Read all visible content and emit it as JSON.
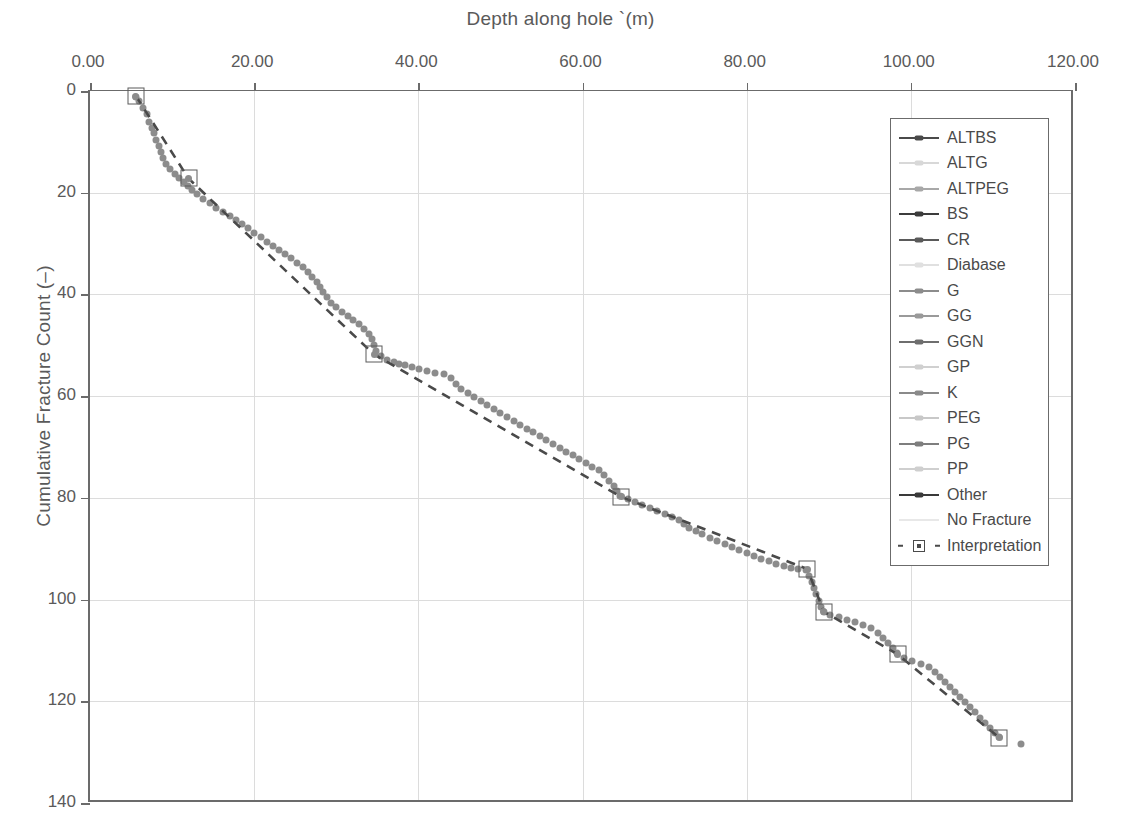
{
  "chart_data": {
    "type": "scatter",
    "title": "",
    "xlabel": "Depth along hole `(m)",
    "ylabel": "Cumulative Fracture Count (–)",
    "xlim": [
      0,
      120
    ],
    "ylim": [
      140,
      0
    ],
    "y_axis_inverted": true,
    "grid": true,
    "xticks": [
      "0.00",
      "20.00",
      "40.00",
      "60.00",
      "80.00",
      "100.00",
      "120.00"
    ],
    "xtick_values": [
      0,
      20,
      40,
      60,
      80,
      100,
      120
    ],
    "yticks": [
      "0",
      "20",
      "40",
      "60",
      "80",
      "100",
      "120",
      "140"
    ],
    "ytick_values": [
      0,
      20,
      40,
      60,
      80,
      100,
      120,
      140
    ],
    "x_axis_position": "top",
    "legend_position": "top-right",
    "legend": [
      {
        "label": "ALTBS",
        "color": "#4a4a4a",
        "style": "line-marker"
      },
      {
        "label": "ALTG",
        "color": "#d8d8d8",
        "style": "line-marker"
      },
      {
        "label": "ALTPEG",
        "color": "#a8a8a8",
        "style": "line-marker"
      },
      {
        "label": "BS",
        "color": "#3c3c3c",
        "style": "line-marker"
      },
      {
        "label": "CR",
        "color": "#5a5a5a",
        "style": "line-marker"
      },
      {
        "label": "Diabase",
        "color": "#e0e0e0",
        "style": "line-marker"
      },
      {
        "label": "G",
        "color": "#8c8c8c",
        "style": "line-marker"
      },
      {
        "label": "GG",
        "color": "#9a9a9a",
        "style": "line-marker"
      },
      {
        "label": "GGN",
        "color": "#6e6e6e",
        "style": "line-marker"
      },
      {
        "label": "GP",
        "color": "#d0d0d0",
        "style": "line-marker"
      },
      {
        "label": "K",
        "color": "#8a8a8a",
        "style": "line-marker"
      },
      {
        "label": "PEG",
        "color": "#c8c8c8",
        "style": "line-marker"
      },
      {
        "label": "PG",
        "color": "#7e7e7e",
        "style": "line-marker"
      },
      {
        "label": "PP",
        "color": "#cfcfcf",
        "style": "line-marker"
      },
      {
        "label": "Other",
        "color": "#3a3a3a",
        "style": "line-marker"
      },
      {
        "label": "No Fracture",
        "color": "#e8e8e8",
        "style": "line"
      },
      {
        "label": "Interpretation",
        "color": "#4a4a4a",
        "style": "dashed-square"
      }
    ],
    "series": [
      {
        "name": "Fracture data points",
        "style": "scatter",
        "color": "#8c8c8c",
        "points": [
          [
            5.6,
            1.2
          ],
          [
            6.0,
            2.0
          ],
          [
            6.4,
            3.4
          ],
          [
            6.9,
            4.6
          ],
          [
            7.2,
            6.0
          ],
          [
            7.5,
            7.2
          ],
          [
            7.8,
            8.3
          ],
          [
            8.1,
            9.6
          ],
          [
            8.4,
            10.8
          ],
          [
            8.6,
            12.0
          ],
          [
            8.9,
            13.2
          ],
          [
            9.3,
            14.3
          ],
          [
            9.8,
            15.4
          ],
          [
            10.3,
            16.3
          ],
          [
            10.9,
            17.1
          ],
          [
            11.4,
            17.8
          ],
          [
            11.9,
            18.6
          ],
          [
            12.4,
            19.4
          ],
          [
            13.0,
            20.3
          ],
          [
            13.8,
            21.2
          ],
          [
            14.6,
            22.1
          ],
          [
            15.4,
            23.0
          ],
          [
            16.2,
            23.8
          ],
          [
            17.0,
            24.6
          ],
          [
            17.8,
            25.4
          ],
          [
            18.5,
            26.2
          ],
          [
            19.2,
            27.0
          ],
          [
            20.0,
            27.9
          ],
          [
            20.8,
            28.8
          ],
          [
            21.6,
            29.6
          ],
          [
            22.3,
            30.4
          ],
          [
            23.0,
            31.2
          ],
          [
            23.8,
            32.0
          ],
          [
            24.5,
            32.9
          ],
          [
            25.2,
            33.8
          ],
          [
            25.9,
            34.7
          ],
          [
            26.5,
            35.6
          ],
          [
            27.1,
            36.6
          ],
          [
            27.6,
            37.6
          ],
          [
            28.0,
            38.6
          ],
          [
            28.4,
            39.6
          ],
          [
            28.9,
            40.6
          ],
          [
            29.4,
            41.6
          ],
          [
            30.0,
            42.5
          ],
          [
            30.7,
            43.4
          ],
          [
            31.4,
            44.2
          ],
          [
            32.1,
            45.0
          ],
          [
            32.8,
            45.9
          ],
          [
            33.4,
            46.8
          ],
          [
            34.0,
            47.8
          ],
          [
            34.4,
            48.8
          ],
          [
            34.6,
            50.0
          ],
          [
            34.9,
            51.2
          ],
          [
            35.5,
            52.2
          ],
          [
            36.2,
            52.8
          ],
          [
            37.0,
            53.2
          ],
          [
            37.7,
            53.6
          ],
          [
            38.4,
            53.9
          ],
          [
            39.2,
            54.2
          ],
          [
            40.1,
            54.6
          ],
          [
            41.0,
            55.0
          ],
          [
            42.0,
            55.4
          ],
          [
            43.1,
            55.6
          ],
          [
            44.0,
            56.4
          ],
          [
            44.6,
            57.6
          ],
          [
            45.2,
            58.6
          ],
          [
            46.0,
            59.4
          ],
          [
            46.8,
            60.2
          ],
          [
            47.6,
            61.0
          ],
          [
            48.4,
            61.8
          ],
          [
            49.2,
            62.6
          ],
          [
            50.0,
            63.4
          ],
          [
            50.8,
            64.1
          ],
          [
            51.6,
            64.9
          ],
          [
            52.4,
            65.6
          ],
          [
            53.2,
            66.4
          ],
          [
            54.0,
            67.1
          ],
          [
            54.8,
            67.9
          ],
          [
            55.6,
            68.6
          ],
          [
            56.4,
            69.4
          ],
          [
            57.2,
            70.1
          ],
          [
            58.0,
            70.9
          ],
          [
            58.8,
            71.6
          ],
          [
            59.6,
            72.4
          ],
          [
            60.4,
            73.1
          ],
          [
            61.2,
            73.9
          ],
          [
            62.0,
            74.6
          ],
          [
            62.6,
            75.6
          ],
          [
            63.2,
            76.6
          ],
          [
            63.8,
            77.6
          ],
          [
            64.2,
            78.6
          ],
          [
            64.6,
            79.6
          ],
          [
            65.5,
            80.2
          ],
          [
            66.4,
            80.8
          ],
          [
            67.3,
            81.4
          ],
          [
            68.2,
            82.0
          ],
          [
            69.1,
            82.6
          ],
          [
            70.0,
            83.2
          ],
          [
            70.9,
            83.8
          ],
          [
            71.8,
            84.4
          ],
          [
            72.4,
            85.2
          ],
          [
            73.0,
            86.0
          ],
          [
            73.8,
            86.6
          ],
          [
            74.6,
            87.2
          ],
          [
            75.5,
            87.8
          ],
          [
            76.4,
            88.4
          ],
          [
            77.3,
            89.0
          ],
          [
            78.2,
            89.6
          ],
          [
            79.1,
            90.2
          ],
          [
            80.0,
            90.8
          ],
          [
            80.9,
            91.4
          ],
          [
            81.8,
            92.0
          ],
          [
            82.7,
            92.5
          ],
          [
            83.6,
            93.0
          ],
          [
            84.5,
            93.4
          ],
          [
            85.4,
            93.8
          ],
          [
            86.3,
            94.0
          ],
          [
            87.2,
            94.2
          ],
          [
            87.6,
            95.4
          ],
          [
            87.9,
            96.6
          ],
          [
            88.2,
            97.8
          ],
          [
            88.5,
            99.0
          ],
          [
            88.8,
            100.2
          ],
          [
            89.1,
            101.4
          ],
          [
            89.4,
            102.4
          ],
          [
            90.2,
            103.0
          ],
          [
            91.2,
            103.5
          ],
          [
            92.2,
            104.0
          ],
          [
            93.2,
            104.5
          ],
          [
            94.2,
            105.0
          ],
          [
            95.2,
            105.6
          ],
          [
            96.0,
            106.6
          ],
          [
            96.6,
            107.6
          ],
          [
            97.2,
            108.6
          ],
          [
            97.8,
            109.6
          ],
          [
            98.3,
            110.6
          ],
          [
            99.2,
            111.4
          ],
          [
            100.2,
            112.0
          ],
          [
            101.2,
            112.6
          ],
          [
            102.2,
            113.2
          ],
          [
            103.0,
            114.2
          ],
          [
            103.6,
            115.2
          ],
          [
            104.2,
            116.2
          ],
          [
            104.8,
            117.2
          ],
          [
            105.4,
            118.2
          ],
          [
            106.0,
            119.2
          ],
          [
            106.6,
            120.2
          ],
          [
            107.2,
            121.2
          ],
          [
            107.8,
            122.2
          ],
          [
            108.4,
            123.2
          ],
          [
            109.0,
            124.2
          ],
          [
            109.6,
            125.2
          ],
          [
            110.2,
            126.2
          ],
          [
            110.8,
            127.0
          ],
          [
            113.4,
            128.4
          ]
        ]
      },
      {
        "name": "Interpretation",
        "style": "dashed-line-square",
        "color": "#4a4a4a",
        "points": [
          [
            5.6,
            1.0
          ],
          [
            12.0,
            17.2
          ],
          [
            34.6,
            51.8
          ],
          [
            64.7,
            79.8
          ],
          [
            87.4,
            94.0
          ],
          [
            89.4,
            102.4
          ],
          [
            98.4,
            110.8
          ],
          [
            110.8,
            127.2
          ]
        ]
      }
    ]
  }
}
